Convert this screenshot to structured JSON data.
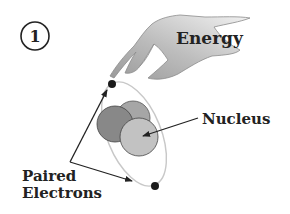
{
  "step_number": "1",
  "labels": {
    "energy": "Energy",
    "nucleus": "Nucleus",
    "paired_line1": "Paired",
    "paired_line2": "Electrons"
  },
  "colors": {
    "hand_fill": "#b8b8b8",
    "hand_light": "#e6e6e6",
    "orbit": "#c8c8c8",
    "nucleon_dark": "#8a8a8a",
    "nucleon_mid": "#a8a8a8",
    "nucleon_light": "#c4c4c4",
    "electron": "#1a1a1a",
    "text": "#222222"
  }
}
